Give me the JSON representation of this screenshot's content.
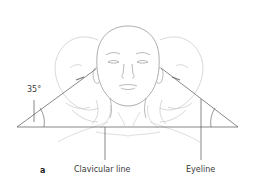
{
  "figure": {
    "panel_letter": "a",
    "angle_label": "35°",
    "labels": {
      "clavicular_line": "Clavicular line",
      "eyeline": "Eyeline"
    },
    "colors": {
      "outline_light": "#bdbdbd",
      "outline_main": "#8a8a8a",
      "construction_line": "#555555",
      "text": "#3a3a3a"
    }
  }
}
